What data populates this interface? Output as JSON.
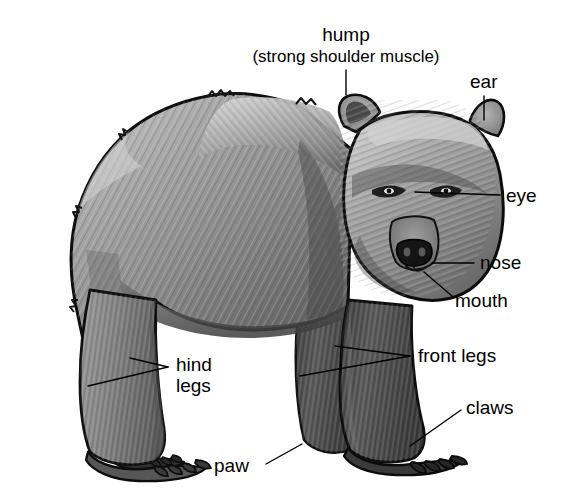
{
  "figure": {
    "style": "grayscale pencil-shaded illustration on white background",
    "background_color": "#ffffff",
    "ink_color": "#000000",
    "fur_light": "#cfcfcf",
    "fur_mid": "#8a8a8a",
    "fur_dark": "#4a4a4a",
    "fur_darkest": "#2b2b2b"
  },
  "labels": [
    {
      "id": "hump",
      "text": "hump",
      "sub_text": "(strong shoulder muscle)",
      "text_x": 346,
      "text_y": 41,
      "sub_x": 346,
      "sub_y": 62,
      "anchor": "middle",
      "leaders": [
        [
          346,
          70,
          346,
          95
        ]
      ]
    },
    {
      "id": "ear",
      "text": "ear",
      "sub_text": "",
      "text_x": 470,
      "text_y": 88,
      "anchor": "start",
      "leaders": [
        [
          484,
          96,
          484,
          120
        ]
      ]
    },
    {
      "id": "eye",
      "text": "eye",
      "sub_text": "",
      "text_x": 506,
      "text_y": 202,
      "anchor": "start",
      "leaders": [
        [
          415,
          192,
          500,
          195
        ]
      ]
    },
    {
      "id": "nose",
      "text": "nose",
      "sub_text": "",
      "text_x": 480,
      "text_y": 269,
      "anchor": "start",
      "leaders": [
        [
          432,
          263,
          474,
          263
        ]
      ]
    },
    {
      "id": "mouth",
      "text": "mouth",
      "sub_text": "",
      "text_x": 455,
      "text_y": 307,
      "anchor": "start",
      "leaders": [
        [
          424,
          272,
          452,
          296
        ]
      ]
    },
    {
      "id": "front-legs",
      "text": "front legs",
      "sub_text": "",
      "text_x": 418,
      "text_y": 362,
      "anchor": "start",
      "leaders": [
        [
          335,
          346,
          410,
          356
        ],
        [
          300,
          376,
          410,
          356
        ]
      ]
    },
    {
      "id": "claws",
      "text": "claws",
      "sub_text": "",
      "text_x": 466,
      "text_y": 414,
      "anchor": "start",
      "leaders": [
        [
          410,
          446,
          461,
          410
        ]
      ]
    },
    {
      "id": "hind-legs",
      "text": "hind",
      "sub_text": "legs",
      "text_x": 176,
      "text_y": 371,
      "sub_x": 176,
      "sub_y": 392,
      "anchor": "start",
      "leaders": [
        [
          88,
          386,
          168,
          367
        ],
        [
          130,
          358,
          168,
          367
        ]
      ]
    },
    {
      "id": "paw",
      "text": "paw",
      "sub_text": "",
      "text_x": 214,
      "text_y": 472,
      "anchor": "start",
      "leaders": [
        [
          266,
          464,
          302,
          444
        ]
      ]
    }
  ]
}
